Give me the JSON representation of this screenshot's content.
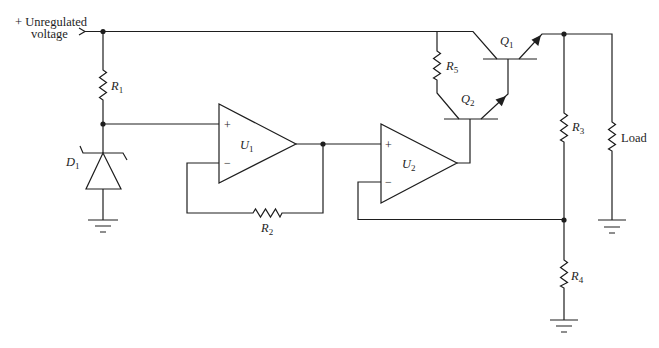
{
  "diagram": {
    "kind": "circuit-schematic",
    "stroke_color": "#1e1e1e",
    "background": "#ffffff"
  },
  "input": {
    "line1": "+ Unregulated",
    "line2": "voltage"
  },
  "components": {
    "R1": {
      "letter": "R",
      "sub": "1"
    },
    "R2": {
      "letter": "R",
      "sub": "2"
    },
    "R3": {
      "letter": "R",
      "sub": "3"
    },
    "R4": {
      "letter": "R",
      "sub": "4"
    },
    "R5": {
      "letter": "R",
      "sub": "5"
    },
    "D1": {
      "letter": "D",
      "sub": "1"
    },
    "U1": {
      "letter": "U",
      "sub": "1"
    },
    "U2": {
      "letter": "U",
      "sub": "2"
    },
    "Q1": {
      "letter": "Q",
      "sub": "1"
    },
    "Q2": {
      "letter": "Q",
      "sub": "2"
    },
    "load": "Load"
  },
  "opamp_pins": {
    "U1": {
      "plus": "+",
      "minus": "−"
    },
    "U2": {
      "plus": "+",
      "minus": "−"
    }
  }
}
